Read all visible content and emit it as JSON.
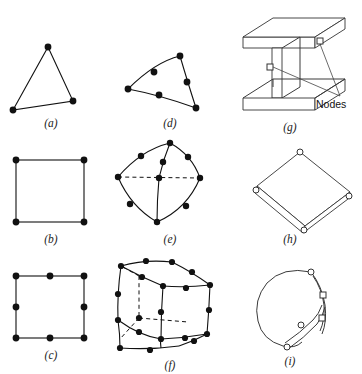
{
  "figure": {
    "background_color": "#ffffff",
    "line_color": "#111111",
    "node_fill_solid": "#111111",
    "node_fill_hollow": "#ffffff",
    "width": 362,
    "height": 374
  },
  "annotations": {
    "nodes_label": "Nodes"
  },
  "panels": [
    {
      "id": "a",
      "caption": "(a)",
      "element_name": "3-node linear triangle",
      "node_count": 3,
      "node_style": "solid",
      "edges": "straight",
      "dimension": "2D",
      "caption_x": 51,
      "caption_y": 127
    },
    {
      "id": "b",
      "caption": "(b)",
      "element_name": "4-node linear quadrilateral",
      "node_count": 4,
      "node_style": "solid",
      "edges": "straight",
      "dimension": "2D",
      "caption_x": 51,
      "caption_y": 243
    },
    {
      "id": "c",
      "caption": "(c)",
      "element_name": "8-node quadratic quadrilateral",
      "node_count": 8,
      "node_style": "solid",
      "edges": "straight",
      "dimension": "2D",
      "caption_x": 51,
      "caption_y": 359
    },
    {
      "id": "d",
      "caption": "(d)",
      "element_name": "6-node curved quadratic triangle",
      "node_count": 6,
      "node_style": "solid",
      "edges": "curved",
      "dimension": "2D",
      "caption_x": 170,
      "caption_y": 127
    },
    {
      "id": "e",
      "caption": "(e)",
      "element_name": "10-node curved quadratic tetrahedron",
      "node_count": 10,
      "node_style": "solid",
      "edges": "curved-with-hidden",
      "dimension": "3D",
      "caption_x": 170,
      "caption_y": 243
    },
    {
      "id": "f",
      "caption": "(f)",
      "element_name": "20-node curved quadratic hexahedron",
      "node_count": 20,
      "node_style": "solid",
      "edges": "curved-with-hidden",
      "dimension": "3D",
      "caption_x": 170,
      "caption_y": 359
    },
    {
      "id": "g",
      "caption": "(g)",
      "element_name": "I-beam solid element with nodes",
      "node_count": 2,
      "node_style": "hollow-square",
      "edges": "straight",
      "dimension": "3D",
      "caption_x": 290,
      "caption_y": 131
    },
    {
      "id": "h",
      "caption": "(h)",
      "element_name": "Flat plate / shell element with thickness",
      "node_count": 4,
      "node_style": "hollow",
      "edges": "straight",
      "dimension": "3D-shell",
      "caption_x": 290,
      "caption_y": 243
    },
    {
      "id": "i",
      "caption": "(i)",
      "element_name": "Curved shell element",
      "node_count": 5,
      "node_style": "hollow",
      "edges": "curved",
      "dimension": "3D-shell",
      "caption_x": 290,
      "caption_y": 359
    }
  ]
}
